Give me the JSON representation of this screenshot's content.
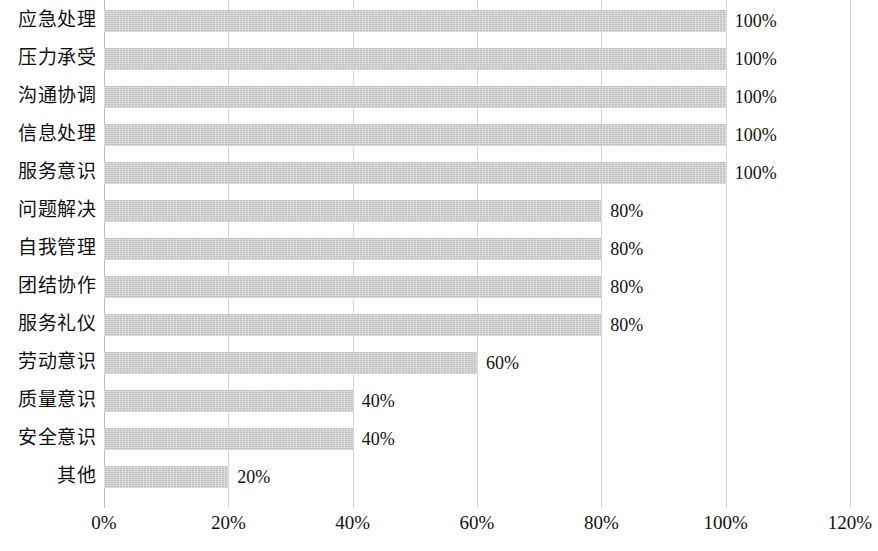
{
  "chart_data": {
    "type": "bar",
    "orientation": "horizontal",
    "title": "",
    "subtitle": "",
    "xlabel": "",
    "ylabel": "",
    "xlim": [
      0,
      120
    ],
    "grid": true,
    "legend": false,
    "legend_position": "none",
    "bar_color": "#c9c9c9",
    "text_color": "#111111",
    "gridline_color": "#d8d8d8",
    "x_ticks": [
      0,
      20,
      40,
      60,
      80,
      100,
      120
    ],
    "x_tick_labels": [
      "0%",
      "20%",
      "40%",
      "60%",
      "80%",
      "100%",
      "120%"
    ],
    "categories": [
      "应急处理",
      "压力承受",
      "沟通协调",
      "信息处理",
      "服务意识",
      "问题解决",
      "自我管理",
      "团结协作",
      "服务礼仪",
      "劳动意识",
      "质量意识",
      "安全意识",
      "其他"
    ],
    "values": [
      100,
      100,
      100,
      100,
      100,
      80,
      80,
      80,
      80,
      60,
      40,
      40,
      20
    ],
    "data_labels": [
      "100%",
      "100%",
      "100%",
      "100%",
      "100%",
      "80%",
      "80%",
      "80%",
      "80%",
      "60%",
      "40%",
      "40%",
      "20%"
    ]
  }
}
